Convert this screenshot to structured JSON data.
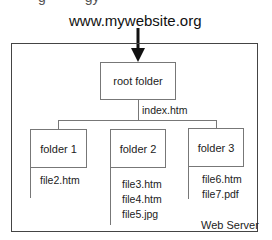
{
  "diagram": {
    "url_label": "www.mywebsite.org",
    "container_label": "Web Server",
    "root": {
      "label": "root folder",
      "files": [
        "index.htm"
      ]
    },
    "folders": [
      {
        "label": "folder 1",
        "files": [
          "file2.htm"
        ]
      },
      {
        "label": "folder 2",
        "files": [
          "file3.htm",
          "file4.htm",
          "file5.jpg"
        ]
      },
      {
        "label": "folder 3",
        "files": [
          "file6.htm",
          "file7.pdf"
        ]
      }
    ],
    "colors": {
      "line": "#777777",
      "border": "#444444",
      "text": "#222222",
      "background": "#ffffff"
    }
  }
}
